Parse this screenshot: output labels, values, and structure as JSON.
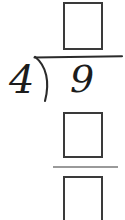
{
  "problem": {
    "type": "long-division",
    "divisor": "4",
    "dividend": "9",
    "quotient_box": "",
    "product_box": "",
    "remainder_box": "",
    "bracket_glyph": "division-bracket",
    "subtraction_rule": ""
  },
  "colors": {
    "background": "#ffffff",
    "box_border": "#3a3a3a",
    "digit": "#1c1c1c",
    "bracket": "#2b2b2b",
    "subtraction_rule": "#9a9a9a"
  }
}
